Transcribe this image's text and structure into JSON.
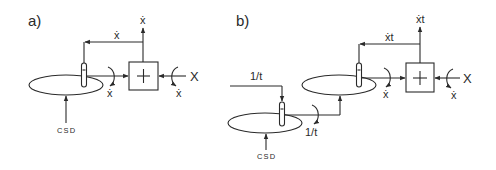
{
  "figure": {
    "panels": [
      {
        "id": "a",
        "label": "a)",
        "turntables": [
          {
            "name": "turntable",
            "input_label": "CSD"
          }
        ],
        "adder": {
          "symbol": "+"
        },
        "labels": {
          "feedback": "ẋ",
          "output": "ẋ",
          "input": "X",
          "input_rotation": "ẋ",
          "shaft_rotation": "ẋ",
          "csd": "CSD"
        }
      },
      {
        "id": "b",
        "label": "b)",
        "turntables": [
          {
            "name": "lower-turntable",
            "input_label": "CSD"
          },
          {
            "name": "upper-turntable"
          }
        ],
        "adder": {
          "symbol": "+"
        },
        "labels": {
          "wheel_input": "1/t",
          "lower_output": "1/t",
          "feedback": "ẋt",
          "output": "ẋt",
          "input": "X",
          "input_rotation": "ẋ",
          "shaft_rotation": "ẋ",
          "csd": "CSD"
        }
      }
    ]
  }
}
